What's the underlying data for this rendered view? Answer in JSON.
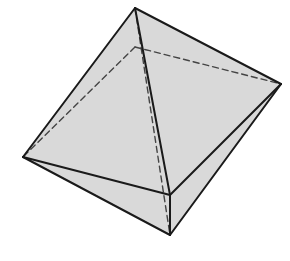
{
  "diagram": {
    "type": "octahedron",
    "fill_color": "#d9d9d9",
    "stroke_color": "#1a1a1a",
    "hidden_stroke_color": "#444444",
    "vertices": {
      "top": [
        135,
        8
      ],
      "back": [
        135,
        47
      ],
      "right": [
        281,
        84
      ],
      "left": [
        23,
        157
      ],
      "front": [
        170,
        195
      ],
      "bottom": [
        170,
        235
      ]
    },
    "visible_edges": [
      [
        "top",
        "left"
      ],
      [
        "top",
        "right"
      ],
      [
        "top",
        "front"
      ],
      [
        "left",
        "front"
      ],
      [
        "front",
        "right"
      ],
      [
        "left",
        "bottom"
      ],
      [
        "bottom",
        "right"
      ],
      [
        "front",
        "bottom"
      ]
    ],
    "hidden_edges": [
      [
        "back",
        "left"
      ],
      [
        "back",
        "right"
      ],
      [
        "top",
        "bottom"
      ]
    ]
  }
}
